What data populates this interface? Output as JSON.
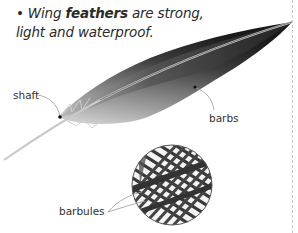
{
  "caption": {
    "bullet": "•",
    "pre": "Wing ",
    "bold": "feathers",
    "post": " are strong,",
    "line2": "light and waterproof."
  },
  "labels": {
    "shaft": "shaft",
    "barbs": "barbs",
    "barbules": "barbules"
  },
  "colors": {
    "feather_dark": "#1e1e1e",
    "feather_light": "#bdbdbd",
    "leader_line": "#999999",
    "divider": "#c8c8c8"
  }
}
